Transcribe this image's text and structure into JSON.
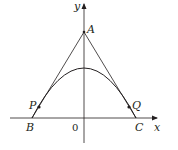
{
  "diagram": {
    "type": "geometry-figure",
    "axes": {
      "x_label": "x",
      "y_label": "y",
      "origin_label": "0"
    },
    "points": {
      "A": "A",
      "B": "B",
      "C": "C",
      "P": "P",
      "Q": "Q"
    },
    "colors": {
      "stroke": "#231f20",
      "background": "#ffffff"
    }
  }
}
